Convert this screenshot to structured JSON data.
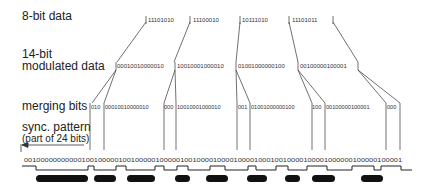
{
  "labels": {
    "eight_bit": "8-bit data",
    "fourteen_bit_line1": "14-bit",
    "fourteen_bit_line2": "modulated data",
    "merging": "merging bits",
    "sync_line1": "sync. pattern",
    "sync_line2": "(part of 24 bits)"
  },
  "eight_bit_words": [
    "11101010",
    "11100010",
    "10111010",
    "11101011"
  ],
  "fourteen_bit_words": [
    "00010010000010",
    "10010001000010",
    "01001000000100",
    "00100000100001"
  ],
  "merging_row": {
    "segments": [
      "010",
      "00010010000010",
      "000",
      "10010001000010",
      "001",
      "01001000000100",
      "100",
      "00100000100001",
      "000"
    ]
  },
  "channel_bits": "00100000000000100100000100100000100000100100001000010000100010010000100001000000100000100001",
  "colors": {
    "ink": "#222222",
    "pits": "#111111",
    "background": "#ffffff"
  }
}
